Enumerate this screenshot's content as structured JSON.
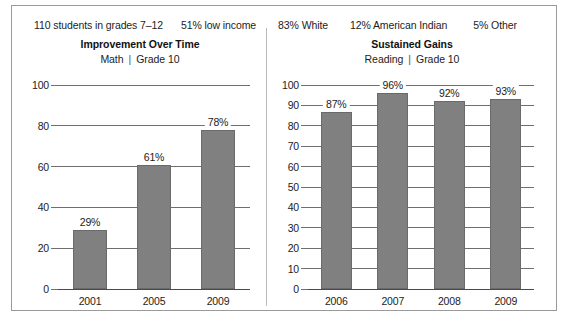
{
  "demographics": [
    {
      "text": "110 students in grades 7–12"
    },
    {
      "text": "51% low income"
    },
    {
      "text": "83% White"
    },
    {
      "text": "12% American Indian"
    },
    {
      "text": "5% Other"
    }
  ],
  "colors": {
    "bar_fill": "#808080",
    "bar_stroke": "#6a6a6a",
    "gridline": "#6f6f6f",
    "panel_border": "#9a9a9a",
    "divider": "#b9b9b9",
    "text": "#1c1c1c"
  },
  "charts": [
    {
      "title": "Improvement Over Time",
      "subject": "Math",
      "subtitle_separator": "|",
      "grade": "Grade 10"
    },
    {
      "title": "Sustained Gains",
      "subject": "Reading",
      "subtitle_separator": "|",
      "grade": "Grade 10"
    }
  ],
  "chart_data": [
    {
      "type": "bar",
      "title": "Improvement Over Time",
      "subtitle": "Math  |  Grade 10",
      "categories": [
        "2001",
        "2005",
        "2009"
      ],
      "values": [
        29,
        61,
        78
      ],
      "data_labels": [
        "29%",
        "61%",
        "78%"
      ],
      "xlabel": "",
      "ylabel": "",
      "ylim": [
        0,
        100
      ],
      "yticks": [
        0,
        20,
        40,
        60,
        80,
        100
      ],
      "ytick_labels": [
        "0",
        "20",
        "40",
        "60",
        "80",
        "100"
      ],
      "grid": true,
      "legend": false
    },
    {
      "type": "bar",
      "title": "Sustained Gains",
      "subtitle": "Reading  |  Grade 10",
      "categories": [
        "2006",
        "2007",
        "2008",
        "2009"
      ],
      "values": [
        87,
        96,
        92,
        93
      ],
      "data_labels": [
        "87%",
        "96%",
        "92%",
        "93%"
      ],
      "xlabel": "",
      "ylabel": "",
      "ylim": [
        0,
        100
      ],
      "yticks": [
        0,
        10,
        20,
        30,
        40,
        50,
        60,
        70,
        80,
        90,
        100
      ],
      "ytick_labels": [
        "0",
        "10",
        "20",
        "30",
        "40",
        "50",
        "60",
        "70",
        "80",
        "90",
        "100"
      ],
      "grid": true,
      "legend": false
    }
  ]
}
